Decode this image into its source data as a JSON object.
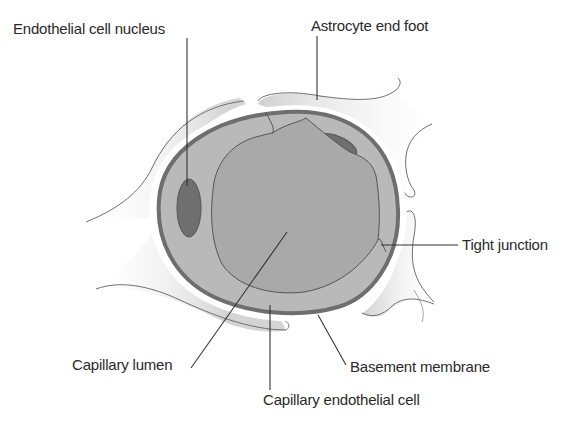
{
  "labels": {
    "endothelial_cell_nucleus": "Endothelial cell nucleus",
    "astrocyte_end_foot": "Astrocyte end foot",
    "tight_junction": "Tight junction",
    "capillary_lumen": "Capillary lumen",
    "basement_membrane": "Basement membrane",
    "capillary_endothelial_cell": "Capillary endothelial cell"
  },
  "colors": {
    "background": "#ffffff",
    "astrocyte_fill": "#d6d6d6",
    "basement_membrane_dark": "#6e6e6e",
    "basement_membrane_light": "#ffffff",
    "endothelial_cell_fill": "#b9b9b9",
    "lumen_fill": "#a9a9a9",
    "nucleus_fill": "#6f6f6f",
    "outline": "#555555",
    "label_text": "#2a2a2a",
    "leader_line": "#333333"
  }
}
